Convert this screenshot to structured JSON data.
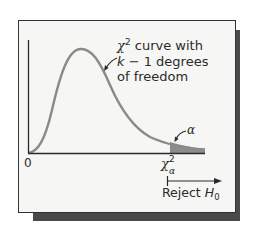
{
  "figure": {
    "curve_label": {
      "chi_symbol": "χ",
      "chi_superscript": "2",
      "line1_rest": " curve with",
      "line2_k": "k",
      "line2_rest": " − 1 degrees",
      "line3": "of freedom"
    },
    "origin_label": "0",
    "alpha_label": "α",
    "critical_value": {
      "symbol": "χ",
      "superscript": "2",
      "subscript": "α"
    },
    "reject_label": {
      "text": "Reject ",
      "h": "H",
      "subscript": "0"
    },
    "colors": {
      "curve": "#8a8a8a",
      "shaded_tail": "#8c8c8c",
      "axis": "#2a2a2a",
      "background": "#f6f6f4",
      "shadow": "#4a4a4a"
    }
  }
}
